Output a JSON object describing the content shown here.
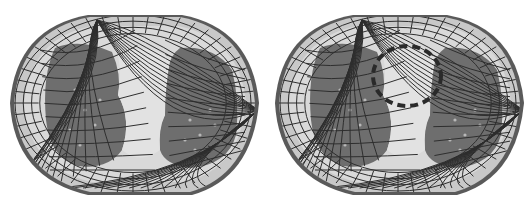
{
  "figure": {
    "panels": [
      {
        "id": "left",
        "description": "Chest cross-section with curvilinear mesh overlay",
        "has_region_marker": false
      },
      {
        "id": "right",
        "description": "Chest cross-section with curvilinear mesh overlay and dashed region marker",
        "has_region_marker": true
      }
    ],
    "colors": {
      "background": "#ffffff",
      "body_outer": "#5a5a5a",
      "body_fill": "#c8c8c8",
      "tissue_light": "#d9d9d9",
      "lung_dark": "#6e6e6e",
      "mesh_line": "#2e2e2e",
      "marker_dash": "#2a2a2a"
    }
  }
}
